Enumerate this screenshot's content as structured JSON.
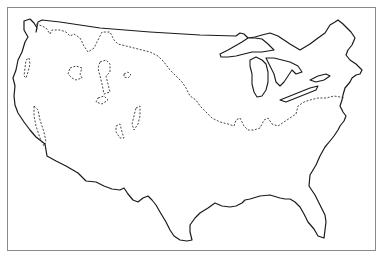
{
  "map": {
    "title": "",
    "subject": "contiguous-united-states-outline",
    "colors": {
      "outline": "#1a1a1a",
      "dashed": "#333333",
      "background": "#ffffff",
      "frame": "#8a8a8a"
    },
    "features": {
      "us_outline": "M24 21 L30 19 L34 23 L37 28 L36 32 L38 22 L42 20 L60 22 L100 28 L150 32 L200 35 L236 36 L240 33 L244 34 L248 38 L255 37 L262 35 L270 33 L278 36 L290 44 L300 50 L310 44 L318 38 L325 33 L330 25 L335 22 L338 20 L343 24 L347 28 L351 32 L355 38 L352 45 L348 50 L346 55 L350 60 L356 64 L362 70 L360 74 L356 75 L352 78 L350 82 L345 88 L343 95 L342 100 L340 106 L343 112 L346 116 L344 121 L340 126 L338 130 L334 136 L330 141 L325 147 L320 156 L316 165 L310 175 L309 186 L315 195 L320 205 L325 215 L326 222 L324 238 L318 236 L314 229 L308 222 L304 214 L300 207 L295 202 L290 199 L285 199 L280 198 L270 195 L260 196 L250 199 L245 200 L242 203 L236 206 L230 207 L222 206 L215 203 L208 208 L200 213 L195 218 L190 225 L190 232 L192 240 L187 241 L180 240 L174 236 L170 230 L166 222 L160 212 L156 205 L152 200 L148 196 L143 198 L138 202 L133 200 L128 194 L124 188 L120 190 L112 189 L104 186 L96 182 L86 181 L78 173 L66 166 L56 161 L47 156 L45 144 L36 137 L30 130 L24 122 L18 113 L15 105 L14 96 L15 86 L13 78 L16 70 L18 60 L22 52 L25 42 L28 37 L24 30 Z",
      "great_lakes": [
        {
          "name": "lake-superior",
          "d": "M220 54 L228 50 L235 46 L242 42 L248 38 L255 38 L262 39 L268 44 L274 50 L262 52 L252 52 L244 54 L236 56 L228 57 L221 57 Z"
        },
        {
          "name": "lake-michigan",
          "d": "M250 60 L256 57 L262 60 L266 64 L268 72 L268 82 L266 90 L262 96 L257 97 L254 92 L252 84 L252 74 L250 66 Z"
        },
        {
          "name": "lake-huron",
          "d": "M266 58 L274 58 L282 60 L290 62 L298 66 L302 72 L296 74 L292 70 L288 76 L284 82 L280 86 L276 82 L274 74 L270 66 Z"
        },
        {
          "name": "lake-erie",
          "d": "M280 100 L290 96 L300 92 L310 88 L318 86 L316 90 L306 94 L296 98 L286 102 Z"
        },
        {
          "name": "lake-ontario",
          "d": "M310 80 L318 76 L326 74 L330 76 L324 80 L316 82 Z"
        }
      ],
      "glacial_boundary": "M36 24 L42 26 L46 28 L50 34 L52 30 L60 30 L66 32 L70 36 L74 34 L80 38 L84 46 L88 52 L94 48 L98 40 L102 32 L110 32 L114 40 L118 44 L126 46 L134 48 L142 50 L150 52 L158 56 L164 62 L170 70 L176 76 L182 82 L186 88 L190 96 L196 100 L200 106 L206 112 L212 118 L220 122 L228 124 L234 126 L236 120 L240 118 L244 126 L248 130 L254 130 L260 128 L264 120 L268 118 L272 124 L278 126 L284 122 L290 118 L296 114 L298 106 L304 102 L310 100 L318 98 L326 98 L334 96 L340 97 L345 98",
      "pluvial_lakes": [
        "M26 60 L29 58 L30 64 L28 72 L26 78 L24 76 L25 68 Z",
        "M70 68 L76 66 L82 68 L80 74 L82 78 L76 80 L72 78 L68 74 Z",
        "M100 62 L106 60 L110 64 L110 72 L106 76 L108 84 L110 92 L104 94 L102 84 L100 76 L98 68 Z",
        "M124 74 L128 72 L131 75 L128 78 L124 77 Z",
        "M98 98 L104 96 L108 100 L102 104 L96 102 Z",
        "M34 106 L38 110 L40 120 L44 132 L46 142 L44 146 L40 138 L36 126 L34 116 Z",
        "M136 108 L140 106 L140 116 L138 124 L134 130 L132 124 L134 116 Z",
        "M116 126 L120 124 L122 132 L124 138 L120 138 L116 132 Z"
      ]
    }
  }
}
